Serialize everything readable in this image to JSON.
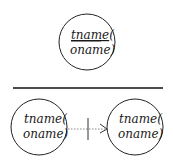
{
  "top_node": {
    "line1": "tname(",
    "line1_underlined_part": "tname",
    "line1_rest": "(",
    "line2": "oname)"
  },
  "divider": {
    "color": "#111111"
  },
  "bottom_left_node": {
    "line1": "tname(",
    "line2": "oname)"
  },
  "bottom_right_node": {
    "line1": "tname(",
    "line2": "oname)"
  },
  "connector": {
    "style": "dotted-arrow-with-crossbar",
    "from": "bottom_left_node",
    "to": "bottom_right_node"
  },
  "colors": {
    "stroke": "#222222",
    "text": "#1a1a1a",
    "dotted": "#888888",
    "background": "#ffffff"
  }
}
